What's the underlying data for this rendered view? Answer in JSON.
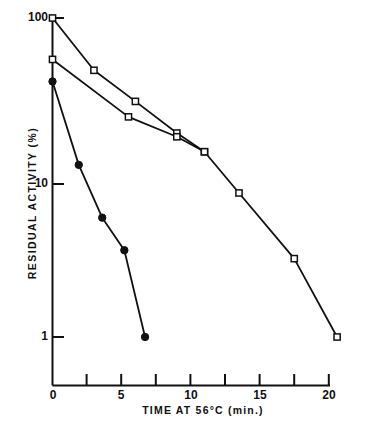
{
  "figure": {
    "background": "#ffffff",
    "ink_color": "#111111"
  },
  "chart_data": {
    "type": "line",
    "title": "",
    "subtitle": "",
    "xlabel": "TIME AT 56°C (min.)",
    "ylabel": "RESIDUAL ACTIVITY (%)",
    "yscale": "log",
    "xscale": "linear",
    "xlim": [
      0,
      21
    ],
    "ylim": [
      0.6,
      100
    ],
    "grid": false,
    "legend": "none",
    "xticks": [
      0,
      5,
      10,
      15,
      20
    ],
    "xtick_labels": [
      "0",
      "5",
      "10",
      "15",
      "20"
    ],
    "xticks_minor": [
      2.5,
      7.5,
      12.5,
      17.5
    ],
    "yticks": [
      1,
      10,
      100
    ],
    "ytick_labels": [
      "1",
      "10",
      "100"
    ],
    "series": [
      {
        "name": "open-squares-upper",
        "marker": "open-square",
        "marker_fill": "#ffffff",
        "color": "#111111",
        "x": [
          0,
          3.0,
          6.0,
          9.0,
          11.0,
          13.5,
          17.5,
          20.6
        ],
        "y": [
          100,
          47,
          30,
          19,
          14.5,
          8.0,
          3.1,
          1.0
        ]
      },
      {
        "name": "open-squares-lower",
        "marker": "open-square",
        "marker_fill": "#ffffff",
        "color": "#111111",
        "x": [
          0,
          5.5,
          9.0,
          11.0
        ],
        "y": [
          55,
          24,
          18,
          14.5
        ]
      },
      {
        "name": "filled-circles",
        "marker": "filled-circle",
        "marker_fill": "#111111",
        "color": "#111111",
        "x": [
          0,
          1.9,
          3.6,
          5.2,
          6.7
        ],
        "y": [
          40,
          12.0,
          5.6,
          3.5,
          1.0
        ]
      }
    ]
  },
  "axes": {
    "y_tick_100": "100",
    "y_tick_10": "10",
    "y_tick_1": "1",
    "x_tick_0": "0",
    "x_tick_5": "5",
    "x_tick_10": "10",
    "x_tick_15": "15",
    "x_tick_20": "20"
  }
}
